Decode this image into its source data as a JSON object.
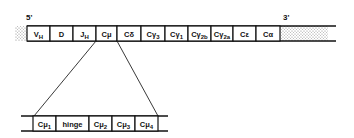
{
  "figure": {
    "five_prime_label": "5'",
    "three_prime_label": "3'",
    "colors": {
      "ink": "#111111",
      "background": "#ffffff",
      "stipple": "#9a9a9a"
    }
  },
  "top_strand": {
    "segments": [
      {
        "main": "V",
        "sub": "H"
      },
      {
        "main": "D",
        "sub": ""
      },
      {
        "main": "J",
        "sub": "H"
      },
      {
        "main": "Cμ",
        "sub": ""
      },
      {
        "main": "Cδ",
        "sub": ""
      },
      {
        "main": "Cγ",
        "sub": "3"
      },
      {
        "main": "Cγ",
        "sub": "1"
      },
      {
        "main": "Cγ",
        "sub": "2b"
      },
      {
        "main": "Cγ",
        "sub": "2a"
      },
      {
        "main": "Cε",
        "sub": ""
      },
      {
        "main": "Cα",
        "sub": ""
      }
    ]
  },
  "bottom_strand": {
    "segments": [
      {
        "main": "Cμ",
        "sub": "1"
      },
      {
        "main": "hinge",
        "sub": ""
      },
      {
        "main": "Cμ",
        "sub": "2"
      },
      {
        "main": "Cμ",
        "sub": "3"
      },
      {
        "main": "Cμ",
        "sub": "4"
      }
    ]
  }
}
